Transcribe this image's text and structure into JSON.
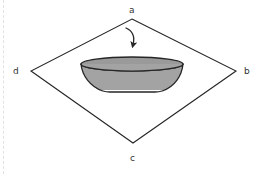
{
  "figure": {
    "background_color": "#ffffff",
    "stroke_color": "#262626",
    "bowl_fill_color": "#a3a3a3",
    "bowl_rim_fill_color": "#9a9a9a",
    "margin_rule_color": "#e2e2e2",
    "labels": {
      "top": "a",
      "right": "b",
      "bottom": "c",
      "left": "d"
    },
    "diamond": {
      "vertices": {
        "top": [
          132,
          19
        ],
        "right": [
          236,
          71
        ],
        "bottom": [
          133,
          143
        ],
        "left": [
          31,
          71
        ]
      }
    },
    "bowl": {
      "rim_center": [
        132,
        64
      ],
      "rim_radius_x": 51,
      "rim_radius_y": 7,
      "base_left": [
        101,
        92
      ],
      "base_right": [
        165,
        92
      ]
    },
    "arrow": {
      "name": "downward-curved-arrow",
      "start": [
        126,
        28
      ],
      "end": [
        133,
        49
      ]
    }
  }
}
